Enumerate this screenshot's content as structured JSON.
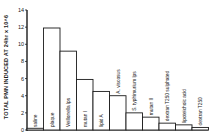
{
  "chart_data": {
    "type": "bar",
    "title": "",
    "xlabel": "",
    "ylabel": "TOTAL PMN INDUCED AT 24hr x 10^6",
    "ylim": [
      0,
      14
    ],
    "yticks": [
      0,
      2,
      4,
      6,
      8,
      10,
      12,
      14
    ],
    "grid": false,
    "legend": null,
    "bar_labels_inside_rotated": true,
    "categories": [
      "saline",
      "plaque",
      "Veillonella lps",
      "mutan I",
      "lipid A",
      "A. viscosus",
      "S. typhimurium lps",
      "mutan II",
      "dextran T250 sulphated",
      "lipoteichoic acid",
      "dextran T250"
    ],
    "values": [
      0.2,
      11.9,
      9.2,
      5.9,
      4.5,
      4.0,
      2.0,
      1.5,
      0.8,
      0.6,
      0.3
    ]
  },
  "colors": {
    "ink": "#1a1a1a",
    "background": "#ffffff"
  }
}
